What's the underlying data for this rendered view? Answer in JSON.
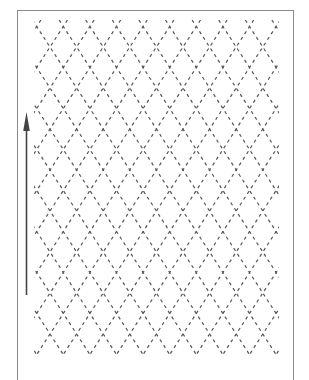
{
  "figure": {
    "title": "",
    "pattern": {
      "type": "diamond-lattice",
      "line_style": "dashed",
      "line_color": "#555555",
      "columns": 9,
      "rows": 8
    },
    "arrow": {
      "direction": "up",
      "color": "#444444"
    },
    "frame_color": "#8a8a8a",
    "background_color": "#ffffff"
  }
}
